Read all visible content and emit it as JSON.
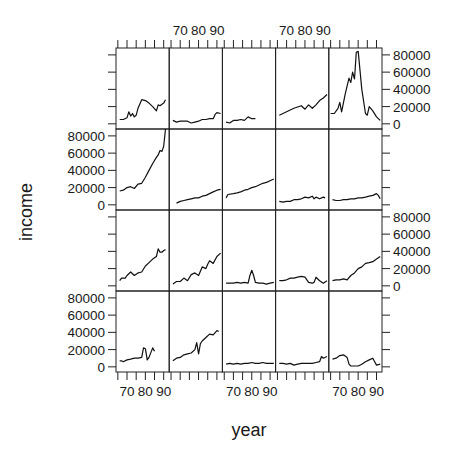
{
  "chart_data": {
    "type": "line",
    "layout": "lattice 5 columns x 4 rows (xyplot panels)",
    "xlabel": "year",
    "ylabel": "income",
    "x_ticks": [
      70,
      80,
      90
    ],
    "x_range": [
      64,
      93
    ],
    "y_ticks": [
      0,
      20000,
      40000,
      60000,
      80000
    ],
    "y_range": [
      -6000,
      88000
    ],
    "x_tick_labels_top_columns": [
      2,
      4
    ],
    "x_tick_labels_bottom_columns": [
      1,
      3,
      5
    ],
    "y_tick_labels_left_rows": [
      2,
      4
    ],
    "y_tick_labels_right_rows": [
      1,
      3
    ],
    "panels": [
      {
        "row": 1,
        "col": 1,
        "x": [
          66,
          68,
          70,
          71,
          72,
          73,
          74,
          75,
          76,
          78,
          80,
          82,
          84,
          86,
          87,
          88,
          90,
          91
        ],
        "y": [
          5000,
          5000,
          7000,
          14000,
          9000,
          12000,
          8000,
          10000,
          18000,
          28000,
          27000,
          24000,
          20000,
          15000,
          22000,
          21000,
          24000,
          28000
        ]
      },
      {
        "row": 1,
        "col": 2,
        "x": [
          66,
          68,
          70,
          72,
          74,
          76,
          78,
          80,
          82,
          84,
          86,
          88,
          89,
          90,
          92
        ],
        "y": [
          4000,
          2000,
          3000,
          3000,
          3000,
          1000,
          2000,
          3000,
          5000,
          5000,
          6000,
          6000,
          11000,
          13000,
          12000
        ]
      },
      {
        "row": 1,
        "col": 3,
        "x": [
          66,
          68,
          70,
          72,
          74,
          76,
          78,
          80,
          82
        ],
        "y": [
          2000,
          1000,
          4000,
          4000,
          5000,
          4000,
          8000,
          6000,
          6000
        ]
      },
      {
        "row": 1,
        "col": 4,
        "x": [
          66,
          70,
          74,
          78,
          80,
          82,
          84,
          86,
          88,
          90,
          92
        ],
        "y": [
          10000,
          14000,
          18000,
          21000,
          17000,
          22000,
          18000,
          22000,
          27000,
          30000,
          34000
        ]
      },
      {
        "row": 1,
        "col": 5,
        "x": [
          65,
          67,
          69,
          70,
          71,
          73,
          75,
          76,
          77,
          78,
          79,
          80,
          82,
          84,
          85,
          86,
          88,
          90,
          92
        ],
        "y": [
          12000,
          12000,
          18000,
          25000,
          14000,
          35000,
          53000,
          48000,
          60000,
          52000,
          83000,
          84000,
          40000,
          12000,
          10000,
          20000,
          15000,
          8000,
          4000
        ]
      },
      {
        "row": 2,
        "col": 1,
        "x": [
          66,
          68,
          70,
          72,
          74,
          76,
          78,
          80,
          82,
          84,
          86,
          87,
          88,
          89,
          90,
          91
        ],
        "y": [
          16000,
          17000,
          20000,
          21000,
          19000,
          24000,
          25000,
          32000,
          40000,
          48000,
          55000,
          58000,
          63000,
          62000,
          68000,
          88000
        ]
      },
      {
        "row": 2,
        "col": 2,
        "x": [
          68,
          70,
          72,
          74,
          76,
          78,
          80,
          82,
          84,
          86,
          88,
          90,
          92
        ],
        "y": [
          2000,
          4000,
          5000,
          6000,
          7000,
          8000,
          8000,
          10000,
          11000,
          13000,
          15000,
          17000,
          18000
        ]
      },
      {
        "row": 2,
        "col": 3,
        "x": [
          66,
          67,
          70,
          72,
          74,
          76,
          78,
          80,
          82,
          84,
          86,
          88,
          90,
          92
        ],
        "y": [
          8000,
          12000,
          13000,
          14000,
          15000,
          17000,
          18000,
          20000,
          21000,
          23000,
          25000,
          26000,
          28000,
          30000
        ]
      },
      {
        "row": 2,
        "col": 4,
        "x": [
          66,
          68,
          70,
          72,
          74,
          76,
          78,
          80,
          82,
          84,
          85,
          86,
          88,
          90,
          91
        ],
        "y": [
          4000,
          3000,
          4000,
          4000,
          6000,
          6000,
          7000,
          9000,
          8000,
          10000,
          7000,
          9000,
          7000,
          9000,
          8000
        ]
      },
      {
        "row": 2,
        "col": 5,
        "x": [
          66,
          68,
          70,
          72,
          74,
          76,
          78,
          80,
          82,
          84,
          86,
          88,
          90,
          91,
          92
        ],
        "y": [
          6000,
          5000,
          5000,
          6000,
          6000,
          7000,
          7000,
          8000,
          8000,
          9000,
          10000,
          11000,
          13000,
          11000,
          7000
        ]
      },
      {
        "row": 3,
        "col": 1,
        "x": [
          66,
          67,
          69,
          70,
          72,
          74,
          76,
          78,
          80,
          82,
          84,
          86,
          87,
          88,
          89,
          90,
          91
        ],
        "y": [
          6000,
          9000,
          9000,
          12000,
          16000,
          12000,
          15000,
          16000,
          23000,
          27000,
          31000,
          34000,
          43000,
          39000,
          39000,
          41000,
          42000
        ]
      },
      {
        "row": 3,
        "col": 2,
        "x": [
          66,
          68,
          70,
          72,
          74,
          76,
          78,
          80,
          82,
          84,
          85,
          86,
          88,
          90,
          92
        ],
        "y": [
          2000,
          5000,
          5000,
          9000,
          6000,
          13000,
          15000,
          12000,
          22000,
          20000,
          25000,
          29000,
          26000,
          34000,
          38000
        ]
      },
      {
        "row": 3,
        "col": 3,
        "x": [
          66,
          68,
          70,
          72,
          74,
          76,
          78,
          79,
          80,
          81,
          82,
          84,
          86,
          88,
          90,
          92
        ],
        "y": [
          3000,
          3000,
          3000,
          4000,
          3000,
          4000,
          3000,
          12000,
          18000,
          12000,
          4000,
          3000,
          3000,
          2000,
          3000,
          4000
        ]
      },
      {
        "row": 3,
        "col": 4,
        "x": [
          66,
          68,
          70,
          72,
          74,
          76,
          78,
          80,
          82,
          84,
          85,
          86,
          88,
          90,
          92
        ],
        "y": [
          6000,
          6000,
          7000,
          9000,
          9000,
          10000,
          11000,
          10000,
          4000,
          3000,
          4000,
          10000,
          6000,
          3000,
          6000
        ]
      },
      {
        "row": 3,
        "col": 5,
        "x": [
          66,
          68,
          70,
          72,
          74,
          76,
          78,
          80,
          82,
          84,
          86,
          88,
          90,
          92
        ],
        "y": [
          6000,
          7000,
          7000,
          8000,
          7000,
          12000,
          15000,
          20000,
          22000,
          26000,
          27000,
          28000,
          31000,
          34000
        ]
      },
      {
        "row": 4,
        "col": 1,
        "x": [
          66,
          67,
          68,
          70,
          72,
          74,
          76,
          78,
          79,
          80,
          81,
          82,
          84,
          85
        ],
        "y": [
          7000,
          7000,
          6000,
          8000,
          9000,
          10000,
          10000,
          11000,
          22000,
          21000,
          8000,
          11000,
          22000,
          18000
        ]
      },
      {
        "row": 4,
        "col": 2,
        "x": [
          66,
          68,
          70,
          72,
          74,
          76,
          78,
          79,
          80,
          81,
          82,
          84,
          86,
          88,
          90,
          91
        ],
        "y": [
          7000,
          10000,
          11000,
          14000,
          15000,
          16000,
          20000,
          28000,
          15000,
          27000,
          30000,
          34000,
          38000,
          37000,
          42000,
          41000
        ]
      },
      {
        "row": 4,
        "col": 3,
        "x": [
          66,
          68,
          70,
          72,
          74,
          76,
          78,
          80,
          82,
          84,
          86,
          88,
          90,
          92
        ],
        "y": [
          3000,
          4000,
          3000,
          4000,
          3000,
          4000,
          4000,
          5000,
          4000,
          4000,
          5000,
          4000,
          4000,
          4000
        ]
      },
      {
        "row": 4,
        "col": 4,
        "x": [
          66,
          68,
          70,
          72,
          74,
          76,
          78,
          80,
          82,
          84,
          86,
          88,
          89,
          90,
          92
        ],
        "y": [
          4000,
          4000,
          3000,
          4000,
          2000,
          3000,
          4000,
          4000,
          4000,
          4000,
          5000,
          6000,
          12000,
          10000,
          12000
        ]
      },
      {
        "row": 4,
        "col": 5,
        "x": [
          66,
          68,
          70,
          72,
          74,
          75,
          76,
          78,
          80,
          82,
          84,
          86,
          88,
          89,
          90,
          92
        ],
        "y": [
          9000,
          10000,
          13000,
          14000,
          11000,
          3000,
          1000,
          1000,
          1000,
          3000,
          6000,
          8000,
          10000,
          6000,
          2000,
          3000
        ]
      }
    ]
  }
}
